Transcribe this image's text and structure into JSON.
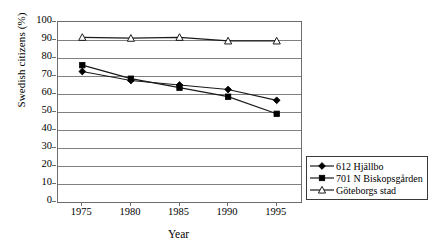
{
  "chart_data": {
    "type": "line",
    "title": "",
    "xlabel": "Year",
    "ylabel": "Swedish citizens (%)",
    "x": [
      1975,
      1980,
      1985,
      1990,
      1995
    ],
    "xtick_labels": [
      "1975",
      "1980",
      "1985",
      "1990",
      "1995"
    ],
    "ytick_labels": [
      "100",
      "90",
      "80",
      "70",
      "60",
      "50",
      "40",
      "30",
      "20",
      "10",
      "0"
    ],
    "ylim": [
      0,
      100
    ],
    "ytick_step": 10,
    "grid": "horizontal",
    "legend_position": "bottom-right-outside",
    "series": [
      {
        "name": "612 Hjällbo",
        "marker": "filled-diamond",
        "values": [
          72.5,
          67.5,
          65.0,
          62.5,
          56.5
        ]
      },
      {
        "name": "701 N Biskopsgården",
        "marker": "filled-square",
        "values": [
          76.0,
          68.5,
          63.5,
          58.5,
          49.0
        ]
      },
      {
        "name": "Göteborgs stad",
        "marker": "open-triangle",
        "values": [
          91.5,
          91.0,
          91.5,
          89.5,
          89.5
        ]
      }
    ],
    "colors": {
      "line": "#1a1a1a",
      "grid": "#808080",
      "axis": "#6e6e6e",
      "marker_fill": "#000000",
      "marker_open_fill": "#ffffff",
      "background": "#ffffff"
    }
  },
  "legend": {
    "items": [
      {
        "label": "612 Hjällbo",
        "marker": "filled-diamond"
      },
      {
        "label": "701 N Biskopsgården",
        "marker": "filled-square"
      },
      {
        "label": "Göteborgs stad",
        "marker": "open-triangle"
      }
    ]
  }
}
